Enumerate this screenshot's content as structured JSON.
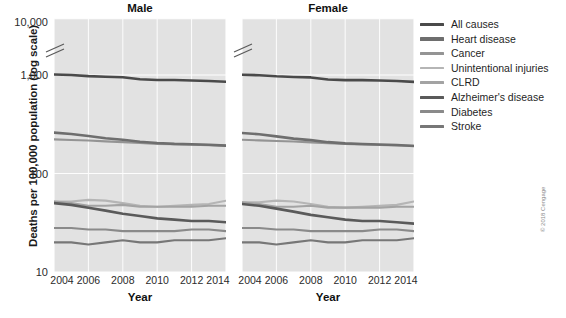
{
  "figure": {
    "ylabel": "Deaths per 100,000 population (log scale)",
    "xlabel": "Year",
    "credit": "© 2018 Cengage"
  },
  "legend": {
    "items": [
      {
        "label": "All causes",
        "color": "#4a4a4a"
      },
      {
        "label": "Heart disease",
        "color": "#6e6e6e"
      },
      {
        "label": "Cancer",
        "color": "#949494"
      },
      {
        "label": "Unintentional injuries",
        "color": "#b5b5b5"
      },
      {
        "label": "CLRD",
        "color": "#a3a3a3"
      },
      {
        "label": "Alzheimer's disease",
        "color": "#5a5a5a"
      },
      {
        "label": "Diabetes",
        "color": "#8a8a8a"
      },
      {
        "label": "Stroke",
        "color": "#777777"
      }
    ]
  },
  "chart_data": {
    "type": "line",
    "title": "",
    "xlabel": "Year",
    "ylabel": "Deaths per 100,000 population (log scale)",
    "yscale": "log",
    "ylim": [
      10,
      10000
    ],
    "yticks": [
      10,
      100,
      1000,
      10000
    ],
    "ytick_labels": [
      "10",
      "100",
      "1,000",
      "10,000"
    ],
    "axis_break": true,
    "axis_break_between": [
      1000,
      10000
    ],
    "grid": true,
    "legend_position": "right",
    "x": [
      2004,
      2005,
      2006,
      2007,
      2008,
      2009,
      2010,
      2011,
      2012,
      2013,
      2014
    ],
    "xticks": [
      2004,
      2006,
      2008,
      2010,
      2012,
      2014
    ],
    "panels": [
      {
        "name": "Male",
        "series": [
          {
            "name": "All causes",
            "color": "#4a4a4a",
            "values": [
              1010,
              1000,
              975,
              960,
              950,
              905,
              890,
              890,
              880,
              870,
              855
            ]
          },
          {
            "name": "Heart disease",
            "color": "#6e6e6e",
            "values": [
              260,
              252,
              240,
              228,
              220,
              210,
              204,
              200,
              198,
              196,
              192
            ]
          },
          {
            "name": "Cancer",
            "color": "#949494",
            "values": [
              222,
              219,
              216,
              212,
              208,
              204,
              200,
              198,
              196,
              194,
              192
            ]
          },
          {
            "name": "Unintentional injuries",
            "color": "#b5b5b5",
            "values": [
              52,
              52,
              54,
              53,
              50,
              47,
              46,
              47,
              48,
              49,
              53
            ]
          },
          {
            "name": "CLRD",
            "color": "#a3a3a3",
            "values": [
              52,
              50,
              47,
              47,
              48,
              46,
              46,
              46,
              46,
              47,
              47
            ]
          },
          {
            "name": "Alzheimer's disease",
            "color": "#5a5a5a",
            "values": [
              50,
              48,
              45,
              42,
              39,
              37,
              35,
              34,
              33,
              33,
              32
            ]
          },
          {
            "name": "Diabetes",
            "color": "#8a8a8a",
            "values": [
              28,
              28,
              27,
              27,
              26,
              26,
              26,
              26,
              27,
              27,
              26
            ]
          },
          {
            "name": "Stroke",
            "color": "#777777",
            "values": [
              20,
              20,
              19,
              20,
              21,
              20,
              20,
              21,
              21,
              21,
              22
            ]
          }
        ]
      },
      {
        "name": "Female",
        "series": [
          {
            "name": "All causes",
            "color": "#4a4a4a",
            "values": [
              1005,
              995,
              970,
              955,
              945,
              900,
              888,
              888,
              878,
              868,
              852
            ]
          },
          {
            "name": "Heart disease",
            "color": "#6e6e6e",
            "values": [
              258,
              250,
              238,
              226,
              218,
              208,
              202,
              199,
              197,
              195,
              190
            ]
          },
          {
            "name": "Cancer",
            "color": "#949494",
            "values": [
              220,
              217,
              214,
              211,
              207,
              203,
              199,
              197,
              195,
              193,
              191
            ]
          },
          {
            "name": "Unintentional injuries",
            "color": "#b5b5b5",
            "values": [
              51,
              51,
              53,
              52,
              49,
              46,
              45,
              46,
              47,
              48,
              52
            ]
          },
          {
            "name": "CLRD",
            "color": "#a3a3a3",
            "values": [
              51,
              49,
              46,
              46,
              47,
              45,
              45,
              45,
              45,
              46,
              46
            ]
          },
          {
            "name": "Alzheimer's disease",
            "color": "#5a5a5a",
            "values": [
              49,
              47,
              44,
              41,
              38,
              36,
              34,
              33,
              33,
              32,
              31
            ]
          },
          {
            "name": "Diabetes",
            "color": "#8a8a8a",
            "values": [
              28,
              28,
              27,
              27,
              26,
              26,
              26,
              26,
              27,
              27,
              26
            ]
          },
          {
            "name": "Stroke",
            "color": "#777777",
            "values": [
              20,
              20,
              19,
              20,
              21,
              20,
              20,
              21,
              21,
              21,
              22
            ]
          }
        ]
      }
    ]
  }
}
